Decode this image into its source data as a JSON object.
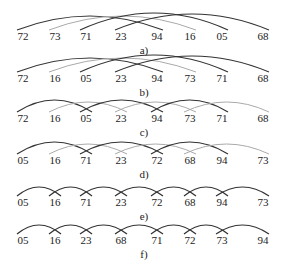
{
  "positions_x": [
    23,
    55,
    86,
    121,
    157,
    190,
    222,
    263
  ],
  "rows": [
    {
      "caption": "a)",
      "y": 40,
      "values": [
        "72",
        "73",
        "71",
        "23",
        "94",
        "16",
        "05",
        "68"
      ],
      "arcs": [
        {
          "from": 0,
          "to": 4,
          "style": "dark",
          "h": 14
        },
        {
          "from": 1,
          "to": 5,
          "style": "light",
          "h": 14
        },
        {
          "from": 2,
          "to": 6,
          "style": "dark",
          "h": 17
        },
        {
          "from": 3,
          "to": 7,
          "style": "dark",
          "h": 16
        }
      ]
    },
    {
      "caption": "b)",
      "y": 82,
      "values": [
        "72",
        "16",
        "05",
        "23",
        "94",
        "73",
        "71",
        "68"
      ],
      "arcs": [
        {
          "from": 0,
          "to": 4,
          "style": "dark",
          "h": 14
        },
        {
          "from": 1,
          "to": 5,
          "style": "light",
          "h": 14
        },
        {
          "from": 2,
          "to": 6,
          "style": "dark",
          "h": 17
        },
        {
          "from": 3,
          "to": 7,
          "style": "dark",
          "h": 16
        }
      ]
    },
    {
      "caption": "c)",
      "y": 122,
      "values": [
        "72",
        "16",
        "05",
        "23",
        "94",
        "73",
        "71",
        "68"
      ],
      "arcs": [
        {
          "from": 0,
          "to": 2,
          "style": "dark",
          "h": 12
        },
        {
          "from": 1,
          "to": 3,
          "style": "light",
          "h": 10
        },
        {
          "from": 2,
          "to": 4,
          "style": "dark",
          "h": 12
        },
        {
          "from": 3,
          "to": 5,
          "style": "light",
          "h": 10
        },
        {
          "from": 4,
          "to": 6,
          "style": "dark",
          "h": 12
        },
        {
          "from": 5,
          "to": 7,
          "style": "light",
          "h": 10
        }
      ]
    },
    {
      "caption": "d)",
      "y": 164,
      "values": [
        "05",
        "16",
        "71",
        "23",
        "72",
        "68",
        "94",
        "73"
      ],
      "arcs": [
        {
          "from": 0,
          "to": 2,
          "style": "dark",
          "h": 12
        },
        {
          "from": 1,
          "to": 3,
          "style": "light",
          "h": 10
        },
        {
          "from": 2,
          "to": 4,
          "style": "dark",
          "h": 12
        },
        {
          "from": 3,
          "to": 5,
          "style": "light",
          "h": 10
        },
        {
          "from": 4,
          "to": 6,
          "style": "dark",
          "h": 12
        },
        {
          "from": 5,
          "to": 7,
          "style": "light",
          "h": 10
        }
      ]
    },
    {
      "caption": "e)",
      "y": 206,
      "values": [
        "05",
        "16",
        "71",
        "23",
        "72",
        "68",
        "94",
        "73"
      ],
      "arcs": [
        {
          "from": 0,
          "to": 1,
          "style": "dark",
          "h": 9
        },
        {
          "from": 1,
          "to": 2,
          "style": "dark",
          "h": 9
        },
        {
          "from": 2,
          "to": 3,
          "style": "dark",
          "h": 9
        },
        {
          "from": 3,
          "to": 4,
          "style": "dark",
          "h": 9
        },
        {
          "from": 4,
          "to": 5,
          "style": "dark",
          "h": 9
        },
        {
          "from": 5,
          "to": 6,
          "style": "dark",
          "h": 9
        },
        {
          "from": 6,
          "to": 7,
          "style": "dark",
          "h": 9
        }
      ]
    },
    {
      "caption": "f)",
      "y": 244,
      "values": [
        "05",
        "16",
        "23",
        "68",
        "71",
        "72",
        "73",
        "94"
      ],
      "arcs": [
        {
          "from": 0,
          "to": 1,
          "style": "dark",
          "h": 9
        },
        {
          "from": 1,
          "to": 2,
          "style": "dark",
          "h": 9
        },
        {
          "from": 2,
          "to": 3,
          "style": "dark",
          "h": 9
        },
        {
          "from": 3,
          "to": 4,
          "style": "dark",
          "h": 9
        },
        {
          "from": 4,
          "to": 5,
          "style": "dark",
          "h": 9
        },
        {
          "from": 5,
          "to": 6,
          "style": "dark",
          "h": 9
        },
        {
          "from": 6,
          "to": 7,
          "style": "dark",
          "h": 9
        }
      ]
    }
  ]
}
